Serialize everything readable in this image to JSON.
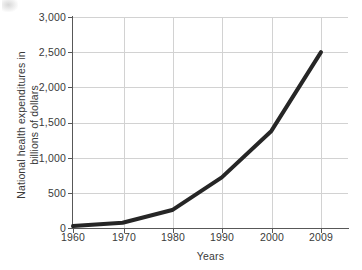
{
  "chart_data": {
    "type": "line",
    "title": "",
    "xlabel": "Years",
    "ylabel_line1": "National health expenditures in",
    "ylabel_line2": "billions of dollars",
    "x_tick_labels": [
      "1960",
      "1970",
      "1980",
      "1990",
      "2000",
      "2009"
    ],
    "y_tick_labels": [
      "0",
      "500",
      "1,000",
      "1,500",
      "2,000",
      "2,500",
      "3,000"
    ],
    "y_tick_values": [
      0,
      500,
      1000,
      1500,
      2000,
      2500,
      3000
    ],
    "ylim": [
      0,
      3000
    ],
    "grid": true,
    "legend": "none",
    "series": [
      {
        "name": "National health expenditures",
        "categories": [
          "1960",
          "1970",
          "1980",
          "1990",
          "2000",
          "2009"
        ],
        "values": [
          27,
          75,
          255,
          720,
          1380,
          2500
        ],
        "color": "#262626",
        "line_width": 4
      }
    ]
  },
  "axes": {
    "x_title": "Years",
    "y_title_line1": "National health expenditures in",
    "y_title_line2": "billions of dollars"
  },
  "ticks": {
    "x": [
      "1960",
      "1970",
      "1980",
      "1990",
      "2000",
      "2009"
    ],
    "y": [
      "3,000",
      "2,500",
      "2,000",
      "1,500",
      "1,000",
      "500",
      "0"
    ]
  },
  "colors": {
    "line": "#262626",
    "grid": "#d2d2d2",
    "axis": "#585858",
    "text": "#3a3a3a",
    "background": "#ffffff"
  }
}
